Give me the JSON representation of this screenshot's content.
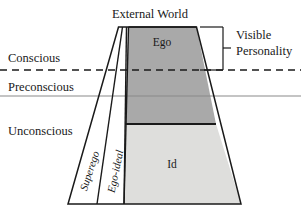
{
  "figure": {
    "title_top": "External World",
    "levels": [
      {
        "id": "conscious",
        "label": "Conscious",
        "x": 8,
        "y": 62
      },
      {
        "id": "preconscious",
        "label": "Preconscious",
        "x": 8,
        "y": 91
      },
      {
        "id": "unconscious",
        "label": "Unconscious",
        "x": 8,
        "y": 135
      }
    ],
    "regions": [
      {
        "id": "ego",
        "label": "Ego",
        "x": 162,
        "y": 46,
        "fill": "#a9a9a9"
      },
      {
        "id": "id",
        "label": "Id",
        "x": 172,
        "y": 168,
        "fill": "#dededc"
      }
    ],
    "vertical_labels": [
      {
        "id": "superego",
        "label": "Superego",
        "x": 93,
        "y": 172,
        "rotation": -72
      },
      {
        "id": "ego-ideal",
        "label": "Ego-ideal",
        "x": 119,
        "y": 172,
        "rotation": -78
      }
    ],
    "bracket": {
      "label_line_1": "Visible",
      "label_line_2": "Personality",
      "x": 236,
      "y1": 39,
      "y2": 55
    },
    "colors": {
      "ego_fill": "#a9a9a9",
      "id_fill": "#dededc",
      "outline": "#1a1a1a",
      "preconscious_line": "#8a8a8a",
      "conscious_line": "#1a1a1a",
      "background": "#ffffff"
    },
    "lines": {
      "conscious_divider_y": 70,
      "preconscious_divider_y": 96,
      "ego_id_divider_y": 124
    }
  }
}
